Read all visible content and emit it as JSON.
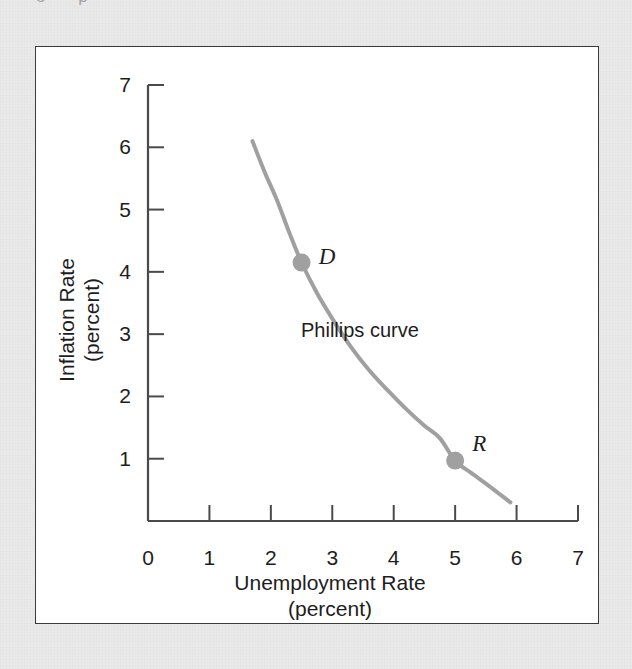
{
  "figure": {
    "background_color": "#e9e9e9",
    "panel_color": "#ffffff",
    "border_color": "#3a3a3a",
    "cut_off_text_above": "o p"
  },
  "chart_data": {
    "type": "line",
    "title": "",
    "xlabel": "Unemployment Rate",
    "xlabel_sub": "(percent)",
    "ylabel": "Inflation Rate",
    "ylabel_sub": "(percent)",
    "xlim": [
      0,
      7
    ],
    "ylim": [
      0,
      7
    ],
    "xticks": [
      0,
      1,
      2,
      3,
      4,
      5,
      6,
      7
    ],
    "yticks": [
      1,
      2,
      3,
      4,
      5,
      6,
      7
    ],
    "xtick_labels": [
      "0",
      "1",
      "2",
      "3",
      "4",
      "5",
      "6",
      "7"
    ],
    "ytick_labels": [
      "1",
      "2",
      "3",
      "4",
      "5",
      "6",
      "7"
    ],
    "grid": false,
    "legend": false,
    "series": [
      {
        "name": "Phillips curve",
        "color": "#a0a0a0",
        "line_width": 4,
        "x": [
          1.7,
          1.9,
          2.1,
          2.3,
          2.5,
          2.75,
          3.0,
          3.3,
          3.6,
          3.9,
          4.2,
          4.5,
          4.75,
          5.0,
          5.25,
          5.5,
          5.7,
          5.9
        ],
        "y": [
          6.1,
          5.6,
          5.15,
          4.63,
          4.15,
          3.66,
          3.25,
          2.8,
          2.42,
          2.1,
          1.8,
          1.53,
          1.33,
          0.97,
          0.78,
          0.6,
          0.45,
          0.3
        ]
      }
    ],
    "annotations": [
      {
        "text": "Phillips curve",
        "x": 3.45,
        "y": 2.95,
        "style": "plain"
      }
    ],
    "points": [
      {
        "label": "D",
        "x": 2.5,
        "y": 4.15,
        "color": "#a0a0a0",
        "radius": 9,
        "label_style": "italic",
        "label_dx": 0.28,
        "label_dy": 0.1
      },
      {
        "label": "R",
        "x": 5.0,
        "y": 0.97,
        "color": "#a0a0a0",
        "radius": 9,
        "label_style": "italic",
        "label_dx": 0.28,
        "label_dy": 0.28
      }
    ]
  }
}
